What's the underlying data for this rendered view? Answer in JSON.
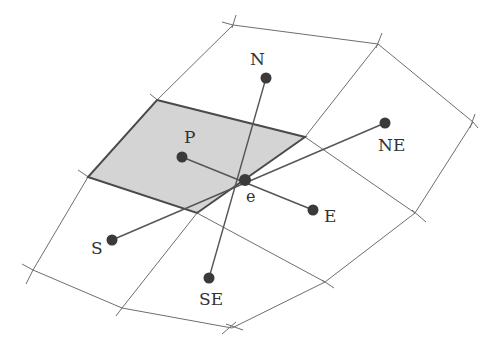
{
  "diagram": {
    "type": "finite-volume-stencil",
    "colors": {
      "background": "#ffffff",
      "cell_fill": "#d4d4d4",
      "cell_stroke": "#4a4a4a",
      "grid_line": "#6e6e6e",
      "node": "#3a3a3a",
      "label": "#333333"
    },
    "labels": {
      "P": "P",
      "N": "N",
      "NE": "NE",
      "E": "E",
      "S": "S",
      "SE": "SE",
      "e": "e"
    },
    "nodes": [
      {
        "id": "P",
        "x": 182,
        "y": 157
      },
      {
        "id": "N",
        "x": 266,
        "y": 78
      },
      {
        "id": "NE",
        "x": 385,
        "y": 123
      },
      {
        "id": "E",
        "x": 313,
        "y": 210
      },
      {
        "id": "S",
        "x": 112,
        "y": 240
      },
      {
        "id": "SE",
        "x": 209,
        "y": 278
      },
      {
        "id": "e",
        "x": 245,
        "y": 180
      }
    ],
    "shaded_cell": "P"
  }
}
